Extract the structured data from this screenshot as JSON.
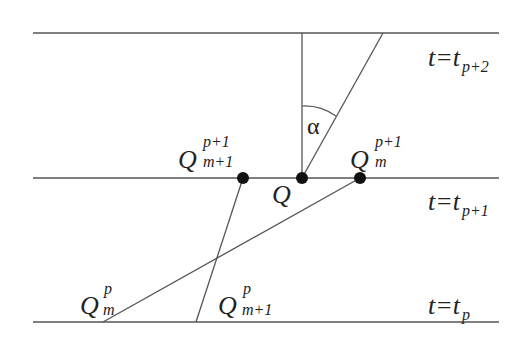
{
  "diagram": {
    "type": "characteristic-lines",
    "colors": {
      "line": "#555555",
      "point": "#111111",
      "text": "#222222"
    },
    "time_levels": [
      {
        "y": 33,
        "label": "t=t",
        "sub": "p+2"
      },
      {
        "y": 178,
        "label": "t=t",
        "sub": "p+1"
      },
      {
        "y": 322,
        "label": "t=t",
        "sub": "p"
      }
    ],
    "points": [
      {
        "id": "Q_m+1_p+1",
        "x": 243,
        "y": 178,
        "base": "Q",
        "sup": "p+1",
        "sub": "m+1"
      },
      {
        "id": "Q",
        "x": 302,
        "y": 178,
        "base": "Q"
      },
      {
        "id": "Q_m_p+1",
        "x": 360,
        "y": 178,
        "base": "Q",
        "sup": "p+1",
        "sub": "m"
      }
    ],
    "bottom_labels": [
      {
        "id": "Q_m_p",
        "base": "Q",
        "sup": "p",
        "sub": "m"
      },
      {
        "id": "Q_m+1_p",
        "base": "Q",
        "sup": "p",
        "sub": "m+1"
      }
    ],
    "angle": {
      "symbol": "α"
    }
  }
}
